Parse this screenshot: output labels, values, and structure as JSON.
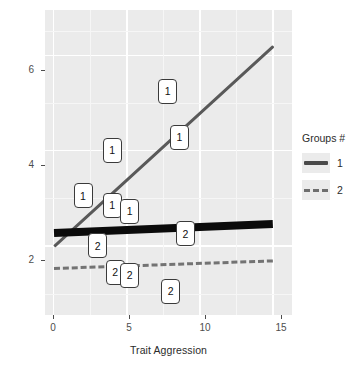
{
  "chart_data": {
    "type": "scatter",
    "title": "",
    "xlabel": "Trait Aggression",
    "ylabel": "Counterproductive Workplace Behaviors",
    "xlim": [
      -0.6,
      16.3
    ],
    "ylim": [
      0.55,
      6.95
    ],
    "xticks": [
      0,
      5,
      10,
      15
    ],
    "yticks": [
      2,
      4,
      6
    ],
    "grid": true,
    "legend": {
      "title": "Groups #",
      "position": "right",
      "entries": [
        {
          "label": "1",
          "style": "solid",
          "color": "#4a4a4a"
        },
        {
          "label": "2",
          "style": "dashed",
          "color": "#6e6e6e"
        }
      ]
    },
    "series": [
      {
        "name": "1",
        "marker_label": "1",
        "line_style": "solid",
        "color": "#595959",
        "fit_line": {
          "x": [
            0,
            15
          ],
          "y": [
            2.0,
            6.2
          ]
        },
        "points": [
          {
            "x": 2.0,
            "y": 3.05
          },
          {
            "x": 4.0,
            "y": 4.0
          },
          {
            "x": 4.0,
            "y": 2.85
          },
          {
            "x": 5.2,
            "y": 2.72
          },
          {
            "x": 7.8,
            "y": 5.25
          },
          {
            "x": 8.6,
            "y": 4.28
          }
        ]
      },
      {
        "name": "2",
        "marker_label": "2",
        "line_style": "dashed",
        "color": "#737373",
        "fit_line": {
          "x": [
            0,
            15
          ],
          "y": [
            1.52,
            1.68
          ]
        },
        "points": [
          {
            "x": 3.0,
            "y": 2.0
          },
          {
            "x": 4.2,
            "y": 1.45
          },
          {
            "x": 5.2,
            "y": 1.38
          },
          {
            "x": 8.0,
            "y": 1.05
          },
          {
            "x": 9.0,
            "y": 2.25
          }
        ]
      },
      {
        "name": "overall",
        "marker_label": "",
        "line_style": "solid-thick",
        "color": "#0b0b0b",
        "fit_line": {
          "x": [
            0,
            15
          ],
          "y": [
            2.28,
            2.47
          ]
        },
        "points": []
      }
    ]
  },
  "axis": {
    "x_title": "Trait Aggression",
    "y_title": "Counterproductive Workplace Behaviors",
    "x_tick_labels": [
      "0",
      "5",
      "10",
      "15"
    ],
    "y_tick_labels": [
      "2",
      "4",
      "6"
    ]
  },
  "legend": {
    "title": "Groups #",
    "items": [
      {
        "label": "1"
      },
      {
        "label": "2"
      }
    ]
  },
  "colors": {
    "panel_bg": "#ebebeb",
    "grid": "#ffffff",
    "group1": "#595959",
    "group2": "#737373",
    "overall": "#0b0b0b",
    "text": "#2b2b2b"
  }
}
